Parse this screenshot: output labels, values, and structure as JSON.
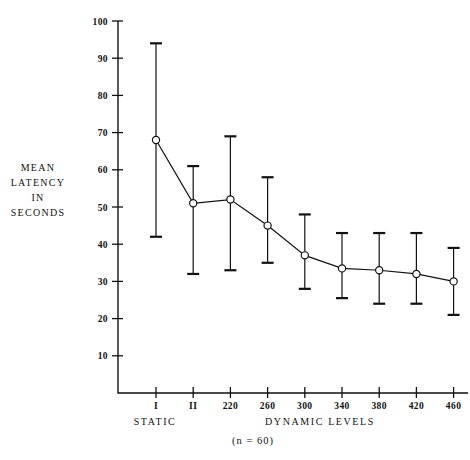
{
  "chart_data": {
    "type": "line",
    "title": "",
    "subtitle": "",
    "xlabel_left": "STATIC",
    "xlabel_right": "DYNAMIC LEVELS",
    "caption": "(n = 60)",
    "ylabel_lines": [
      "MEAN",
      "LATENCY",
      "IN",
      "SECONDS"
    ],
    "ylabel": "MEAN LATENCY IN SECONDS",
    "ylim": [
      0,
      100
    ],
    "ytick_labels": [
      "100",
      "90",
      "80",
      "70",
      "60",
      "50",
      "40",
      "30",
      "20",
      "10"
    ],
    "ytick_values": [
      100,
      90,
      80,
      70,
      60,
      50,
      40,
      30,
      20,
      10
    ],
    "grid": false,
    "legend": "none",
    "marker": "open-circle",
    "errorbars": true,
    "categories": [
      "I",
      "II",
      "220",
      "260",
      "300",
      "340",
      "380",
      "420",
      "460"
    ],
    "values": [
      68,
      51,
      52,
      45,
      37,
      33.5,
      33,
      32,
      30
    ],
    "error_upper": [
      94,
      61,
      69,
      58,
      48,
      43,
      43,
      43,
      39
    ],
    "error_lower": [
      42,
      32,
      33,
      35,
      28,
      25.5,
      24,
      24,
      21
    ],
    "series": [
      {
        "name": "Mean latency",
        "values": [
          68,
          51,
          52,
          45,
          37,
          33.5,
          33,
          32,
          30
        ]
      }
    ],
    "points": [
      {
        "x": "I",
        "mean": 68,
        "upper": 94,
        "lower": 42,
        "group": "STATIC"
      },
      {
        "x": "II",
        "mean": 51,
        "upper": 61,
        "lower": 32,
        "group": "STATIC"
      },
      {
        "x": "220",
        "mean": 52,
        "upper": 69,
        "lower": 33,
        "group": "DYNAMIC LEVELS"
      },
      {
        "x": "260",
        "mean": 45,
        "upper": 58,
        "lower": 35,
        "group": "DYNAMIC LEVELS"
      },
      {
        "x": "300",
        "mean": 37,
        "upper": 48,
        "lower": 28,
        "group": "DYNAMIC LEVELS"
      },
      {
        "x": "340",
        "mean": 33.5,
        "upper": 43,
        "lower": 25.5,
        "group": "DYNAMIC LEVELS"
      },
      {
        "x": "380",
        "mean": 33,
        "upper": 43,
        "lower": 24,
        "group": "DYNAMIC LEVELS"
      },
      {
        "x": "420",
        "mean": 32,
        "upper": 43,
        "lower": 24,
        "group": "DYNAMIC LEVELS"
      },
      {
        "x": "460",
        "mean": 30,
        "upper": 39,
        "lower": 21,
        "group": "DYNAMIC LEVELS"
      }
    ],
    "colors": {
      "ink": "#111111",
      "background": "#ffffff",
      "marker_fill": "#ffffff"
    }
  }
}
